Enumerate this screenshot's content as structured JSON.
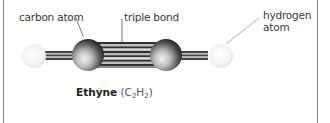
{
  "diagram": {
    "labels": {
      "carbon_atom": "carbon atom",
      "triple_bond": "triple bond",
      "hydrogen_atom_line1": "hydrogen",
      "hydrogen_atom_line2": "atom"
    },
    "caption": {
      "name": "Ethyne",
      "formula_open": "(C",
      "sub1": "2",
      "formula_mid": "H",
      "sub2": "2",
      "formula_close": ")"
    },
    "atoms": [
      {
        "type": "hydrogen",
        "color": "#f2f2f2"
      },
      {
        "type": "carbon",
        "color": "#555555"
      },
      {
        "type": "carbon",
        "color": "#555555"
      },
      {
        "type": "hydrogen",
        "color": "#f2f2f2"
      }
    ],
    "bonds": [
      {
        "between": "H-C",
        "order": 1
      },
      {
        "between": "C-C",
        "order": 3
      },
      {
        "between": "C-H",
        "order": 1
      }
    ]
  }
}
